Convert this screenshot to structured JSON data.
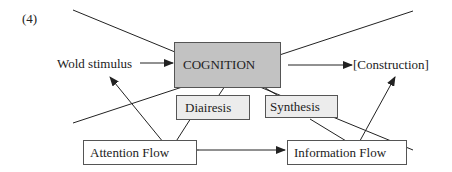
{
  "figure_label": "(4)",
  "nodes": {
    "world_stimulus": "Wold stimulus",
    "cognition": "COGNITION",
    "construction": "[Construction]",
    "diairesis": "Diairesis",
    "synthesis": "Synthesis",
    "attention_flow": "Attention Flow",
    "information_flow": "Information Flow"
  },
  "edges": [
    {
      "from": "world_stimulus",
      "to": "cognition",
      "type": "arrow"
    },
    {
      "from": "cognition",
      "to": "construction",
      "type": "arrow"
    },
    {
      "from": "attention_flow",
      "to": "information_flow",
      "type": "bidirectional-arrow"
    },
    {
      "from": "attention_flow",
      "to": "world_stimulus",
      "type": "arrow"
    },
    {
      "from": "information_flow",
      "to": "construction",
      "type": "arrow"
    },
    {
      "from": "diairesis",
      "to": "cognition",
      "type": "line"
    },
    {
      "from": "diairesis",
      "to": "attention_flow",
      "type": "line"
    },
    {
      "from": "synthesis",
      "to": "cognition",
      "type": "line"
    },
    {
      "from": "synthesis",
      "to": "information_flow",
      "type": "line"
    }
  ],
  "colors": {
    "cognition_fill": "#c2c2c2",
    "sub_fill": "#ececec",
    "line": "#222222"
  }
}
